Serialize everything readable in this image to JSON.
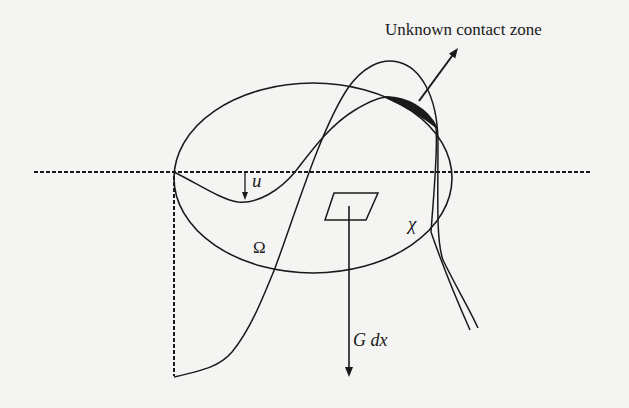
{
  "figure": {
    "labels": {
      "contact_zone": "Unknown contact zone",
      "displacement": "u",
      "domain": "Ω",
      "obstacle": "χ",
      "force": "G dx"
    },
    "colors": {
      "background": "#f4f4f2",
      "ink": "#1a1a1a"
    },
    "elements": [
      "dashed-reference-line",
      "vertical-dashed-line",
      "domain-ellipse",
      "deformed-body-curve",
      "obstacle-curve",
      "contact-zone-region",
      "contact-zone-pointer-arrow",
      "area-element-parallelogram",
      "force-arrow",
      "displacement-arrow"
    ]
  }
}
